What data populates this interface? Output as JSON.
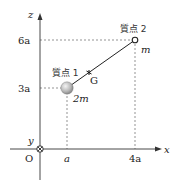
{
  "diagram": {
    "axes": {
      "x_label": "x",
      "y_label": "y",
      "z_label": "z",
      "origin_label": "O",
      "y_axis_symbol": "into-page (⊗)"
    },
    "ticks": {
      "x": [
        "a",
        "4a"
      ],
      "z": [
        "3a",
        "6a"
      ]
    },
    "particles": [
      {
        "name": "質点 1",
        "mass": "2m",
        "x": "a",
        "z": "3a",
        "style": "large gray sphere"
      },
      {
        "name": "質点 2",
        "mass": "m",
        "x": "4a",
        "z": "6a",
        "style": "small open circle"
      }
    ],
    "center_of_mass": {
      "label": "G"
    },
    "colors": {
      "axis": "#333333",
      "dashed": "#555555",
      "rod": "#222222",
      "sphere_light": "#e8e8e8",
      "sphere_dark": "#8a8a8a"
    }
  },
  "labels": {
    "x": "x",
    "y": "y",
    "z": "z",
    "origin": "O",
    "tick_a": "a",
    "tick_4a": "4a",
    "tick_3a": "3a",
    "tick_6a": "6a",
    "p1_name": "質点 1",
    "p1_mass": "2m",
    "p2_name": "質点 2",
    "p2_mass": "m",
    "g": "G"
  }
}
